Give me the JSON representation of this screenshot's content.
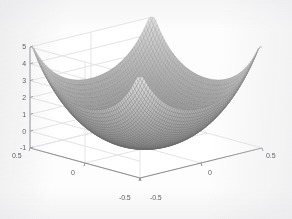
{
  "figure": {
    "title": "",
    "background_color": "#ffffff",
    "axis_line_color": "#8d8d93",
    "grid_color": "#e4e4e8",
    "pane_color": "#ffffff",
    "tick_label_color": "#5e5e62",
    "surface_mesh_color": "#8a8a8a"
  },
  "chart_data": {
    "type": "surface",
    "title": "",
    "xlabel": "",
    "ylabel": "",
    "zlabel": "",
    "grid": true,
    "legend": "none",
    "projection": "3d-mesh",
    "shading": "grayscale-mesh",
    "xlim": [
      -0.5,
      0.5
    ],
    "ylim": [
      -0.5,
      0.5
    ],
    "zlim": [
      -1,
      5
    ],
    "xticks": [
      -0.5,
      0,
      0.5
    ],
    "yticks": [
      -0.5,
      0,
      0.5
    ],
    "zticks": [
      -1,
      0,
      1,
      2,
      3,
      4,
      5
    ],
    "xticklabels": [
      "-0.5",
      "0",
      "0.5"
    ],
    "yticklabels": [
      "-0.5",
      "0",
      "0.5"
    ],
    "zticklabels": [
      "-1",
      "0",
      "1",
      "2",
      "3",
      "4",
      "5"
    ],
    "surface_peak_value": 4.2,
    "surface_valley_value": -0.9,
    "grid_resolution": 62,
    "z_samples_on_diagonal": [
      4.1,
      3.3,
      2.2,
      1.0,
      0.0,
      -0.7,
      -0.9,
      -0.7,
      0.0,
      1.0,
      2.2,
      3.3,
      4.1
    ],
    "z_samples_on_edge_y_min": [
      4.1,
      3.4,
      2.7,
      2.3,
      2.1,
      2.0,
      2.1,
      2.3,
      2.7,
      3.4,
      4.1
    ]
  },
  "zticklabels": {
    "t0": "5",
    "t1": "4",
    "t2": "3",
    "t3": "2",
    "t4": "1",
    "t5": "0",
    "t6": "-1"
  },
  "yticklabels": {
    "t0": "0.5",
    "t1": "0",
    "t2": "-0.5"
  },
  "xticklabels": {
    "t0": "-0.5",
    "t1": "0",
    "t2": "0.5"
  }
}
